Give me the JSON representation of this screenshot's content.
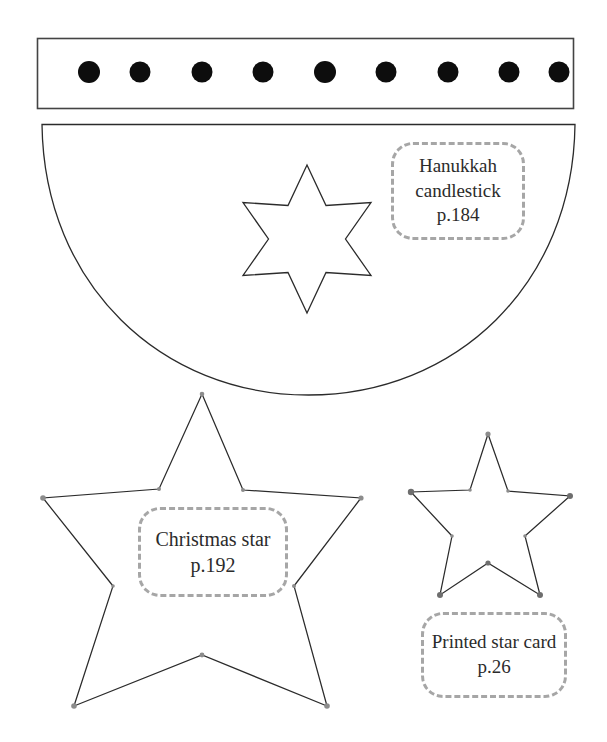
{
  "page": {
    "background_color": "#ffffff",
    "ink_color": "#231f20",
    "dash_color": "#a6a6a6",
    "width": 607,
    "height": 742
  },
  "templates": [
    {
      "id": "candle-holder-strip",
      "shape_name": "rectangle-strip-with-nine-holes",
      "holes": 9,
      "hole_color": "#000000"
    },
    {
      "id": "semicircle-base",
      "shape_name": "half-disc",
      "cutout": "six-pointed-star"
    },
    {
      "id": "christmas-star",
      "shape_name": "five-pointed-star-large"
    },
    {
      "id": "printed-star-card",
      "shape_name": "five-pointed-star-small"
    }
  ],
  "labels": [
    {
      "id": "hanukkah",
      "line1": "Hanukkah",
      "line2": "candlestick",
      "line3": "p.184"
    },
    {
      "id": "christmas",
      "line1": "Christmas star",
      "line2": "p.192",
      "line3": ""
    },
    {
      "id": "printed",
      "line1": "Printed star card",
      "line2": "p.26",
      "line3": ""
    }
  ]
}
